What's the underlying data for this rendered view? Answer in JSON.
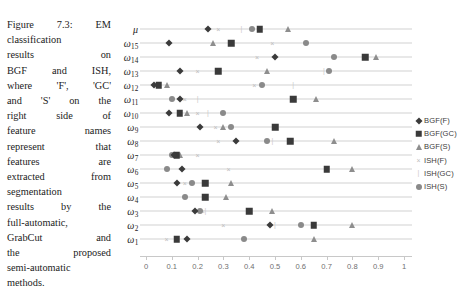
{
  "caption": {
    "lines": [
      "Figure 7.3: EM",
      "classification",
      "results on",
      "BGF and ISH,",
      "where 'F', 'GC'",
      "and 'S' on the",
      "right side of",
      "feature names",
      "represent that",
      "features are",
      "extracted from",
      "segmentation",
      "results by the",
      "full-automatic,",
      "GrabCut and",
      "the proposed",
      "semi-automatic",
      "methods."
    ],
    "full_text": "Figure 7.3: EM classification results on BGF and ISH, where 'F', 'GC' and 'S' on the right side of feature names represent that features are extracted from segmentation results by the full-automatic, GrabCut and the proposed semi-automatic methods."
  },
  "legend": {
    "position": "right",
    "entries": [
      {
        "label": "BGF(F)",
        "marker": "diamond",
        "color": "#3b3b3b"
      },
      {
        "label": "BGF(GC)",
        "marker": "square",
        "color": "#3a3a3a"
      },
      {
        "label": "BGF(S)",
        "marker": "triangle",
        "color": "#8e8e8e"
      },
      {
        "label": "ISH(F)",
        "marker": "x",
        "color": "#bdbdbd"
      },
      {
        "label": "ISH(GC)",
        "marker": "tick",
        "color": "#c9c9c9"
      },
      {
        "label": "ISH(S)",
        "marker": "circle",
        "color": "#8a8a8a"
      }
    ]
  },
  "chart_data": {
    "type": "scatter",
    "title": "",
    "xlabel": "",
    "ylabel": "",
    "xlim": [
      0,
      1
    ],
    "ylim": [
      0,
      17
    ],
    "grid": true,
    "legend_position": "right",
    "xticks": [
      0,
      0.1,
      0.2,
      0.3,
      0.4,
      0.5,
      0.6,
      0.7,
      0.8,
      0.9,
      1
    ],
    "xticklabels": [
      "0",
      "0.1",
      "0.2",
      "0.3",
      "0.4",
      "0.5",
      "0.6",
      "0.7",
      "0.8",
      "0.9",
      "1"
    ],
    "categories": [
      "μ",
      "ω15",
      "ω14",
      "ω13",
      "ω12",
      "ω11",
      "ω10",
      "ω9",
      "ω8",
      "ω7",
      "ω6",
      "ω5",
      "ω4",
      "ω3",
      "ω2",
      "ω1"
    ],
    "category_labels": [
      {
        "base": "μ",
        "sub": ""
      },
      {
        "base": "ω",
        "sub": "15"
      },
      {
        "base": "ω",
        "sub": "14"
      },
      {
        "base": "ω",
        "sub": "13"
      },
      {
        "base": "ω",
        "sub": "12"
      },
      {
        "base": "ω",
        "sub": "11"
      },
      {
        "base": "ω",
        "sub": "10"
      },
      {
        "base": "ω",
        "sub": "9"
      },
      {
        "base": "ω",
        "sub": "8"
      },
      {
        "base": "ω",
        "sub": "7"
      },
      {
        "base": "ω",
        "sub": "6"
      },
      {
        "base": "ω",
        "sub": "5"
      },
      {
        "base": "ω",
        "sub": "4"
      },
      {
        "base": "ω",
        "sub": "3"
      },
      {
        "base": "ω",
        "sub": "2"
      },
      {
        "base": "ω",
        "sub": "1"
      }
    ],
    "series": [
      {
        "name": "BGF(F)",
        "marker": "diamond",
        "values": [
          0.24,
          0.09,
          0.5,
          0.13,
          0.03,
          0.13,
          0.09,
          0.21,
          0.35,
          0.11,
          0.14,
          0.12,
          null,
          0.19,
          0.48,
          0.16
        ]
      },
      {
        "name": "BGF(GC)",
        "marker": "square",
        "values": [
          0.44,
          0.33,
          0.85,
          0.28,
          0.05,
          0.57,
          0.13,
          0.5,
          0.56,
          0.12,
          0.7,
          0.23,
          0.23,
          0.4,
          0.65,
          0.12
        ]
      },
      {
        "name": "BGF(S)",
        "marker": "triangle",
        "values": [
          0.55,
          0.26,
          0.89,
          0.47,
          0.08,
          0.66,
          0.16,
          0.3,
          0.73,
          0.13,
          0.8,
          0.33,
          0.31,
          0.49,
          0.8,
          0.65
        ]
      },
      {
        "name": "ISH(F)",
        "marker": "x",
        "values": [
          0.28,
          0.49,
          0.43,
          0.2,
          0.42,
          0.15,
          0.2,
          0.27,
          0.28,
          0.2,
          0.32,
          0.15,
          null,
          0.22,
          0.3,
          0.08
        ]
      },
      {
        "name": "ISH(GC)",
        "marker": "tick",
        "values": [
          0.37,
          null,
          null,
          0.69,
          0.57,
          0.2,
          0.24,
          null,
          0.49,
          null,
          null,
          null,
          null,
          0.23,
          0.5,
          null
        ]
      },
      {
        "name": "ISH(S)",
        "marker": "circle",
        "values": [
          0.41,
          0.62,
          0.73,
          0.71,
          0.45,
          0.1,
          0.3,
          0.33,
          0.47,
          0.1,
          0.08,
          0.18,
          0.15,
          0.21,
          0.6,
          0.38
        ]
      }
    ]
  }
}
